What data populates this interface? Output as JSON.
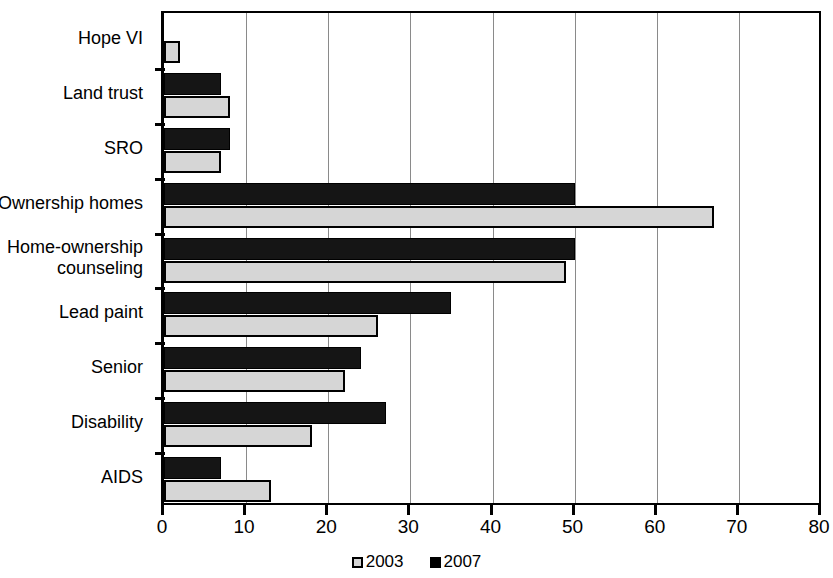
{
  "chart_data": {
    "type": "bar",
    "orientation": "horizontal",
    "title": "",
    "subtitle": "",
    "xlabel": "",
    "ylabel": "",
    "categories": [
      "Hope VI",
      "Land trust",
      "SRO",
      "Ownership homes",
      "Home-ownership\ncounseling",
      "Lead paint",
      "Senior",
      "Disability",
      "AIDS"
    ],
    "series": [
      {
        "name": "2003",
        "color": "#d6d6d6",
        "values": [
          2,
          8,
          7,
          67,
          49,
          26,
          22,
          18,
          13
        ]
      },
      {
        "name": "2007",
        "color": "#151515",
        "values": [
          0,
          7,
          8,
          50,
          50,
          35,
          24,
          27,
          7
        ]
      }
    ],
    "xlim": [
      0,
      80
    ],
    "xticks": [
      0,
      10,
      20,
      30,
      40,
      50,
      60,
      70,
      80
    ],
    "xtick_labels": [
      "0",
      "10",
      "20",
      "30",
      "40",
      "50",
      "60",
      "70",
      "80"
    ],
    "grid": "vertical",
    "legend_position": "bottom-center",
    "legend_entries": [
      {
        "label": "2003",
        "swatch": "light-gray-square"
      },
      {
        "label": "2007",
        "swatch": "black-square"
      }
    ]
  }
}
